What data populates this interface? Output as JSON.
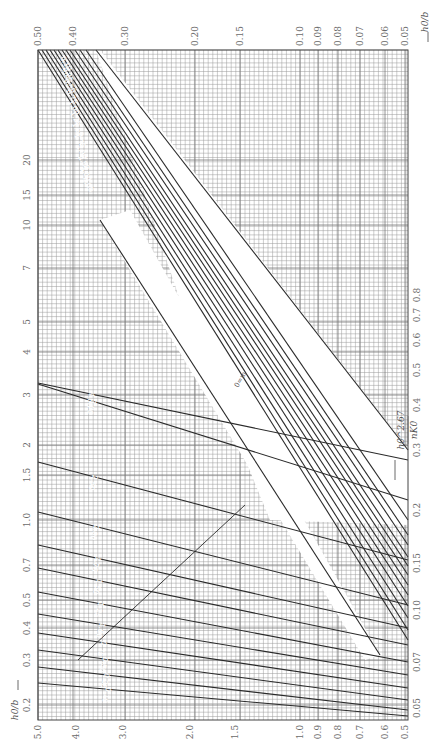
{
  "chart_data": {
    "type": "line",
    "title": "",
    "orientation_note": "printed rotated 90 degrees counter-clockwise",
    "xlabel": "h0^2.67 / (n K0)",
    "ylabel": "h0 / b",
    "left_axis_ticks": [
      "0.2",
      "0.3",
      "0.4",
      "0.5",
      "0.7",
      "1.0",
      "1.5",
      "2",
      "3",
      "4",
      "5",
      "7",
      "10",
      "15",
      "20"
    ],
    "right_axis_ticks": [
      "0.05",
      "0.07",
      "0.10",
      "0.15",
      "0.2",
      "0.3",
      "0.4",
      "0.5",
      "0.6",
      "0.7",
      "0.8"
    ],
    "top_axis_ticks": [
      "0.50",
      "0.40",
      "0.30",
      "0.20",
      "0.15",
      "0.10",
      "0.09",
      "0.08",
      "0.07",
      "0.06",
      "0.05"
    ],
    "bottom_axis_ticks": [
      "5.0",
      "4.0",
      "3.0",
      "2.0",
      "1.5",
      "1.0",
      "0.9",
      "0.8",
      "0.7",
      "0.6",
      "0.5"
    ],
    "series_parameter": "m",
    "series": [
      {
        "name": "m=0"
      },
      {
        "name": "0.10"
      },
      {
        "name": "0.25"
      },
      {
        "name": "0.50"
      },
      {
        "name": "0.75"
      },
      {
        "name": "1.00"
      },
      {
        "name": "1.25"
      },
      {
        "name": "1.50"
      },
      {
        "name": "1.75"
      },
      {
        "name": "2.00"
      },
      {
        "name": "2.50"
      },
      {
        "name": "3.00"
      },
      {
        "name": "4.00"
      }
    ],
    "grid": true,
    "scale": "log-log"
  },
  "labels": {
    "top_axis_title": "h0/b",
    "bottom_axis_title": "h0/b",
    "formula_numerator": "h0^2.67",
    "formula_denominator": "nK0",
    "m_zero_label": "0=m"
  },
  "geometry": {
    "grid": {
      "x0": 38,
      "y0": 50,
      "x1": 408,
      "y1": 720
    },
    "left_ticks_y": [
      705,
      660,
      628,
      600,
      565,
      520,
      475,
      445,
      395,
      352,
      322,
      268,
      225,
      195,
      160
    ],
    "right_ticks_y": [
      708,
      662,
      610,
      563,
      510,
      450,
      405,
      370,
      340,
      315,
      295
    ],
    "top_ticks_x": [
      38,
      73,
      125,
      195,
      240,
      300,
      318,
      338,
      360,
      385,
      405
    ],
    "bottom_ticks_x": [
      38,
      76,
      123,
      190,
      235,
      300,
      318,
      338,
      360,
      385,
      405
    ],
    "lower_family": [
      {
        "label": "4.00",
        "pts": [
          [
            38,
            383
          ],
          [
            408,
            460
          ]
        ]
      },
      {
        "label": "3.00",
        "pts": [
          [
            38,
            384
          ],
          [
            408,
            500
          ]
        ]
      },
      {
        "label": "2.50",
        "pts": [
          [
            38,
            462
          ],
          [
            408,
            560
          ]
        ]
      },
      {
        "label": "2.00",
        "pts": [
          [
            38,
            512
          ],
          [
            408,
            605
          ]
        ]
      },
      {
        "label": "1.75",
        "pts": [
          [
            38,
            545
          ],
          [
            408,
            628
          ]
        ]
      },
      {
        "label": "1.50",
        "pts": [
          [
            38,
            568
          ],
          [
            408,
            645
          ]
        ]
      },
      {
        "label": "1.25",
        "pts": [
          [
            38,
            592
          ],
          [
            408,
            662
          ]
        ]
      },
      {
        "label": "1.00",
        "pts": [
          [
            38,
            614
          ],
          [
            408,
            675
          ]
        ]
      },
      {
        "label": "0.75",
        "pts": [
          [
            38,
            633
          ],
          [
            408,
            688
          ]
        ]
      },
      {
        "label": "0.50",
        "pts": [
          [
            38,
            650
          ],
          [
            408,
            700
          ]
        ]
      },
      {
        "label": "0.25",
        "pts": [
          [
            38,
            667
          ],
          [
            408,
            710
          ]
        ]
      },
      {
        "label": "0.10",
        "pts": [
          [
            38,
            683
          ],
          [
            408,
            716
          ]
        ]
      }
    ],
    "upper_family": [
      {
        "label": "0.10",
        "pts": [
          [
            38,
            50
          ],
          [
            408,
            640
          ]
        ]
      },
      {
        "label": "0.25",
        "pts": [
          [
            42,
            50
          ],
          [
            408,
            630
          ]
        ]
      },
      {
        "label": "0.50",
        "pts": [
          [
            46,
            50
          ],
          [
            408,
            618
          ]
        ]
      },
      {
        "label": "0.75",
        "pts": [
          [
            50,
            50
          ],
          [
            408,
            606
          ]
        ]
      },
      {
        "label": "1.00",
        "pts": [
          [
            54,
            50
          ],
          [
            408,
            595
          ]
        ]
      },
      {
        "label": "1.25",
        "pts": [
          [
            58,
            50
          ],
          [
            408,
            585
          ]
        ]
      },
      {
        "label": "1.50",
        "pts": [
          [
            62,
            50
          ],
          [
            408,
            575
          ]
        ]
      },
      {
        "label": "1.75",
        "pts": [
          [
            66,
            50
          ],
          [
            408,
            566
          ]
        ]
      },
      {
        "label": "2.00",
        "pts": [
          [
            70,
            50
          ],
          [
            408,
            557
          ]
        ]
      },
      {
        "label": "2.50",
        "pts": [
          [
            75,
            50
          ],
          [
            408,
            545
          ]
        ]
      },
      {
        "label": "3.00",
        "pts": [
          [
            80,
            50
          ],
          [
            408,
            535
          ]
        ]
      },
      {
        "label": "4.00",
        "pts": [
          [
            86,
            50
          ],
          [
            408,
            520
          ]
        ]
      }
    ]
  }
}
